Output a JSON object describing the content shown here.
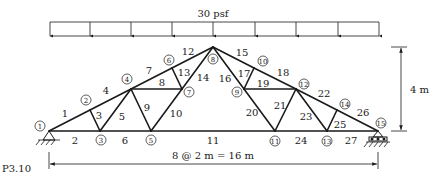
{
  "figure": {
    "label": "P3.10",
    "load_label": "30 psf",
    "span_dimension": "8 @ 2 m = 16 m",
    "height_dimension": "4 m"
  },
  "geometry": {
    "nodes": [
      {
        "id": "1",
        "x": 49,
        "y": 131
      },
      {
        "id": "2",
        "x": 90,
        "y": 110
      },
      {
        "id": "3",
        "x": 100,
        "y": 131
      },
      {
        "id": "4",
        "x": 131,
        "y": 89
      },
      {
        "id": "5",
        "x": 151,
        "y": 131
      },
      {
        "id": "6",
        "x": 172,
        "y": 68
      },
      {
        "id": "7",
        "x": 182,
        "y": 89
      },
      {
        "id": "8",
        "x": 213,
        "y": 47
      },
      {
        "id": "9",
        "x": 244,
        "y": 89
      },
      {
        "id": "10",
        "x": 254,
        "y": 68
      },
      {
        "id": "11",
        "x": 275,
        "y": 131
      },
      {
        "id": "12",
        "x": 296,
        "y": 89
      },
      {
        "id": "13",
        "x": 327,
        "y": 131
      },
      {
        "id": "14",
        "x": 337,
        "y": 110
      },
      {
        "id": "15",
        "x": 378,
        "y": 131
      }
    ],
    "members": [
      {
        "id": "1",
        "from": "1",
        "to": "2"
      },
      {
        "id": "2",
        "from": "1",
        "to": "3"
      },
      {
        "id": "3",
        "from": "2",
        "to": "3"
      },
      {
        "id": "4",
        "from": "2",
        "to": "4"
      },
      {
        "id": "5",
        "from": "3",
        "to": "4"
      },
      {
        "id": "6",
        "from": "3",
        "to": "5"
      },
      {
        "id": "7",
        "from": "4",
        "to": "6"
      },
      {
        "id": "8",
        "from": "4",
        "to": "7"
      },
      {
        "id": "9",
        "from": "4",
        "to": "5"
      },
      {
        "id": "10",
        "from": "5",
        "to": "7"
      },
      {
        "id": "11",
        "from": "5",
        "to": "11"
      },
      {
        "id": "12",
        "from": "6",
        "to": "8"
      },
      {
        "id": "13",
        "from": "6",
        "to": "7"
      },
      {
        "id": "14",
        "from": "7",
        "to": "8"
      },
      {
        "id": "15",
        "from": "8",
        "to": "10"
      },
      {
        "id": "16",
        "from": "8",
        "to": "9"
      },
      {
        "id": "17",
        "from": "9",
        "to": "10"
      },
      {
        "id": "18",
        "from": "10",
        "to": "12"
      },
      {
        "id": "19",
        "from": "9",
        "to": "12"
      },
      {
        "id": "20",
        "from": "9",
        "to": "11"
      },
      {
        "id": "21",
        "from": "11",
        "to": "12"
      },
      {
        "id": "22",
        "from": "12",
        "to": "14"
      },
      {
        "id": "23",
        "from": "12",
        "to": "13"
      },
      {
        "id": "24",
        "from": "11",
        "to": "13"
      },
      {
        "id": "25",
        "from": "13",
        "to": "14"
      },
      {
        "id": "26",
        "from": "14",
        "to": "15"
      },
      {
        "id": "27",
        "from": "13",
        "to": "15"
      }
    ],
    "member_labels": [
      {
        "id": "1",
        "x": 65,
        "y": 113
      },
      {
        "id": "2",
        "x": 75,
        "y": 140
      },
      {
        "id": "3",
        "x": 99,
        "y": 115
      },
      {
        "id": "4",
        "x": 106,
        "y": 90
      },
      {
        "id": "5",
        "x": 122,
        "y": 116
      },
      {
        "id": "6",
        "x": 125,
        "y": 140
      },
      {
        "id": "7",
        "x": 149,
        "y": 70
      },
      {
        "id": "8",
        "x": 162,
        "y": 82
      },
      {
        "id": "9",
        "x": 147,
        "y": 107
      },
      {
        "id": "10",
        "x": 176,
        "y": 113
      },
      {
        "id": "11",
        "x": 213,
        "y": 140
      },
      {
        "id": "12",
        "x": 188,
        "y": 51
      },
      {
        "id": "13",
        "x": 184,
        "y": 72
      },
      {
        "id": "14",
        "x": 203,
        "y": 77
      },
      {
        "id": "15",
        "x": 242,
        "y": 52
      },
      {
        "id": "16",
        "x": 225,
        "y": 78
      },
      {
        "id": "17",
        "x": 244,
        "y": 73
      },
      {
        "id": "18",
        "x": 283,
        "y": 72
      },
      {
        "id": "19",
        "x": 263,
        "y": 83
      },
      {
        "id": "20",
        "x": 252,
        "y": 112
      },
      {
        "id": "21",
        "x": 280,
        "y": 105
      },
      {
        "id": "22",
        "x": 324,
        "y": 93
      },
      {
        "id": "23",
        "x": 306,
        "y": 116
      },
      {
        "id": "24",
        "x": 301,
        "y": 140
      },
      {
        "id": "25",
        "x": 340,
        "y": 124
      },
      {
        "id": "26",
        "x": 363,
        "y": 112
      },
      {
        "id": "27",
        "x": 351,
        "y": 140
      }
    ],
    "node_label_positions": [
      {
        "id": "1",
        "x": 40,
        "y": 126
      },
      {
        "id": "2",
        "x": 86,
        "y": 100
      },
      {
        "id": "3",
        "x": 101,
        "y": 140
      },
      {
        "id": "4",
        "x": 127,
        "y": 79
      },
      {
        "id": "5",
        "x": 151,
        "y": 140
      },
      {
        "id": "6",
        "x": 169,
        "y": 60
      },
      {
        "id": "7",
        "x": 189,
        "y": 92
      },
      {
        "id": "8",
        "x": 213,
        "y": 59
      },
      {
        "id": "9",
        "x": 237,
        "y": 92
      },
      {
        "id": "10",
        "x": 263,
        "y": 61
      },
      {
        "id": "11",
        "x": 275,
        "y": 141
      },
      {
        "id": "12",
        "x": 304,
        "y": 84
      },
      {
        "id": "13",
        "x": 327,
        "y": 141
      },
      {
        "id": "14",
        "x": 345,
        "y": 104
      },
      {
        "id": "15",
        "x": 381,
        "y": 123
      }
    ],
    "load": {
      "x1": 50,
      "x2": 379,
      "top": 22,
      "bottom": 36,
      "arrow_xs": [
        50,
        90,
        131,
        172,
        213,
        255,
        296,
        338,
        379
      ]
    }
  }
}
